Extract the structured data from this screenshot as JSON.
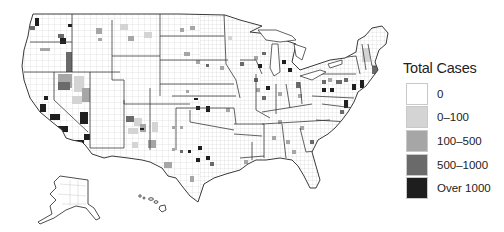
{
  "map": {
    "title": "Total Cases",
    "subject": "United States county-level map of total cases",
    "regions_shown": [
      "Contiguous United States",
      "Alaska",
      "Hawaii"
    ],
    "boundary_levels": [
      "state",
      "county"
    ],
    "colors": {
      "background": "#ffffff",
      "state_border": "#3a3a3a",
      "county_border": "#b8b8b8"
    }
  },
  "legend": {
    "title": "Total Cases",
    "items": [
      {
        "label": "0",
        "color": "#ffffff"
      },
      {
        "label": "0–100",
        "color": "#d4d4d4"
      },
      {
        "label": "100–500",
        "color": "#a6a6a6"
      },
      {
        "label": "500–1000",
        "color": "#6a6a6a"
      },
      {
        "label": "Over 1000",
        "color": "#1e1e1e"
      }
    ]
  }
}
